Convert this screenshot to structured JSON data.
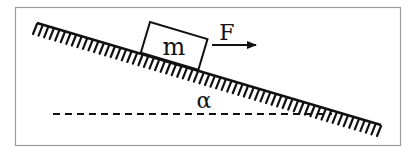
{
  "diagram": {
    "type": "inclined-plane-force-diagram",
    "block_label": "m",
    "force_label": "F",
    "angle_label": "α",
    "colors": {
      "stroke": "#111111",
      "frame": "#9a9a9a",
      "background": "#ffffff"
    }
  }
}
